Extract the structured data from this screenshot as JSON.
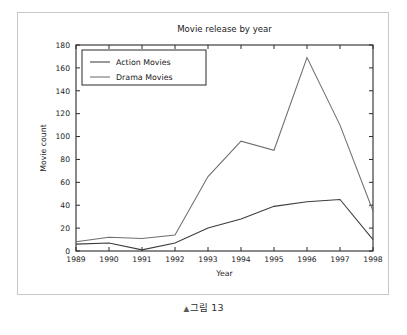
{
  "figure": {
    "caption_marker": "▲",
    "caption_text": "그림 13"
  },
  "chart_data": {
    "type": "line",
    "title": "Movie release by year",
    "xlabel": "Year",
    "ylabel": "Movie count",
    "x": [
      1989,
      1990,
      1991,
      1992,
      1993,
      1994,
      1995,
      1996,
      1997,
      1998
    ],
    "categories": [
      "1989",
      "1990",
      "1991",
      "1992",
      "1993",
      "1994",
      "1995",
      "1996",
      "1997",
      "1998"
    ],
    "xlim": [
      1989,
      1998
    ],
    "ylim": [
      0,
      180
    ],
    "xticks": [
      "1989",
      "1990",
      "1991",
      "1992",
      "1993",
      "1994",
      "1995",
      "1996",
      "1997",
      "1998"
    ],
    "yticks": [
      "0",
      "20",
      "40",
      "60",
      "80",
      "100",
      "120",
      "140",
      "160",
      "180"
    ],
    "ytick_values": [
      0,
      20,
      40,
      60,
      80,
      100,
      120,
      140,
      160,
      180
    ],
    "grid": false,
    "legend_position": "upper left",
    "series": [
      {
        "name": "Action Movies",
        "color": "#3c3c3c",
        "values": [
          6,
          7,
          1,
          7,
          20,
          28,
          39,
          43,
          45,
          10
        ]
      },
      {
        "name": "Drama Movies",
        "color": "#6e6e6e",
        "values": [
          8,
          12,
          11,
          14,
          65,
          96,
          88,
          169,
          110,
          35
        ]
      }
    ]
  }
}
